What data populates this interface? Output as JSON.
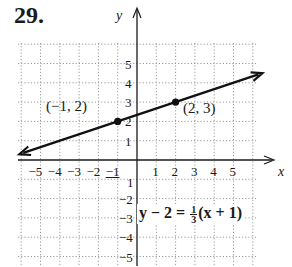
{
  "problem_number": "29.",
  "chart_data": {
    "type": "line",
    "title": "",
    "xlabel": "x",
    "ylabel": "y",
    "xlim": [
      -6,
      6
    ],
    "ylim": [
      -6,
      6
    ],
    "grid": true,
    "x_ticks": [
      -5,
      -4,
      -3,
      -2,
      -1,
      1,
      2,
      3,
      4,
      5
    ],
    "y_ticks": [
      -5,
      -4,
      -3,
      -2,
      -1,
      1,
      2,
      3,
      4,
      5
    ],
    "x_tick_labels": [
      "−5",
      "−4",
      "−3",
      "−2",
      "−1",
      "1",
      "2",
      "3",
      "4",
      "5"
    ],
    "y_tick_labels": [
      "−5",
      "−4",
      "−3",
      "−2",
      "−1",
      "1",
      "2",
      "3",
      "4",
      "5"
    ],
    "series": [
      {
        "name": "y − 2 = 1/3(x + 1)",
        "slope": 0.3333,
        "intercept": 2.3333,
        "x": [
          -6,
          6
        ],
        "y": [
          0.3333,
          4.3333
        ],
        "arrows": "both"
      }
    ],
    "points": [
      {
        "x": -1,
        "y": 2,
        "label": "(−1, 2)"
      },
      {
        "x": 2,
        "y": 3,
        "label": "(2, 3)"
      }
    ],
    "annotations": [
      {
        "text": "y − 2 = 1/3(x + 1)",
        "x": 0.1,
        "y": -3
      }
    ]
  },
  "labels": {
    "x_axis": "x",
    "y_axis": "y",
    "point1": "(−1, 2)",
    "point2": "(2, 3)",
    "eq_left": "y − 2 = ",
    "eq_num": "1",
    "eq_den": "3",
    "eq_right": "(x + 1)"
  },
  "ticks": {
    "x": [
      "−5",
      "−4",
      "−3",
      "−2",
      "−1",
      "1",
      "2",
      "3",
      "4",
      "5"
    ],
    "y_pos": [
      "5",
      "4",
      "3",
      "2",
      "1"
    ],
    "y_neg": [
      "−1",
      "−2",
      "−3",
      "−4",
      "−5"
    ]
  }
}
